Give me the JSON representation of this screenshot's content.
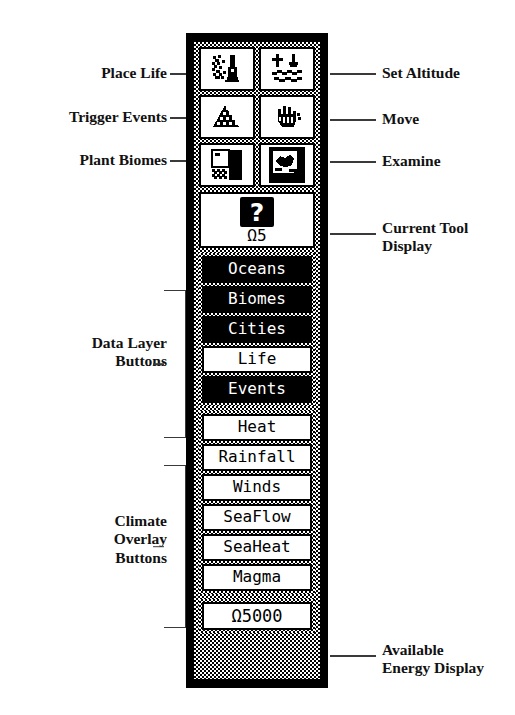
{
  "panel": {
    "tools": [
      {
        "id": "place-life",
        "label": "Place Life",
        "icon": "place-life-icon",
        "side": "left"
      },
      {
        "id": "set-altitude",
        "label": "Set Altitude",
        "icon": "set-altitude-icon",
        "side": "right"
      },
      {
        "id": "trigger-events",
        "label": "Trigger Events",
        "icon": "trigger-events-icon",
        "side": "left"
      },
      {
        "id": "move",
        "label": "Move",
        "icon": "move-hand-icon",
        "side": "right"
      },
      {
        "id": "plant-biomes",
        "label": "Plant Biomes",
        "icon": "plant-biomes-icon",
        "side": "left"
      },
      {
        "id": "examine",
        "label": "Examine",
        "icon": "examine-magnifier-icon",
        "side": "right"
      }
    ],
    "current_tool": {
      "glyph": "?",
      "icon": "question-mark-icon",
      "cost": "Ω5"
    },
    "data_layers": [
      {
        "label": "Oceans",
        "selected": false
      },
      {
        "label": "Biomes",
        "selected": false
      },
      {
        "label": "Cities",
        "selected": false
      },
      {
        "label": "Life",
        "selected": true
      },
      {
        "label": "Events",
        "selected": false
      }
    ],
    "climate_overlays": [
      {
        "label": "Heat",
        "selected": true
      },
      {
        "label": "Rainfall",
        "selected": true
      },
      {
        "label": "Winds",
        "selected": true
      },
      {
        "label": "SeaFlow",
        "selected": true
      },
      {
        "label": "SeaHeat",
        "selected": true
      },
      {
        "label": "Magma",
        "selected": true
      }
    ],
    "energy": {
      "value": "Ω5000"
    }
  },
  "annotations": {
    "place_life": "Place Life",
    "trigger_events": "Trigger Events",
    "plant_biomes": "Plant Biomes",
    "set_altitude": "Set Altitude",
    "move": "Move",
    "examine": "Examine",
    "current_tool_display": "Current Tool\nDisplay",
    "data_layer_buttons": "Data Layer\nButtons",
    "climate_overlay_buttons": "Climate\nOverlay\nButtons",
    "available_energy_display": "Available\nEnergy Display"
  },
  "colors": {
    "ink": "#000000",
    "paper": "#ffffff",
    "leader": "#3a3a3a"
  }
}
